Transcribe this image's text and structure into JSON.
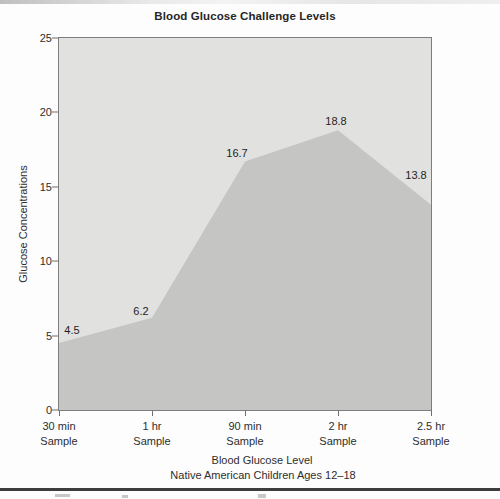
{
  "chart_data": {
    "type": "area",
    "title": "Blood Glucose Challenge Levels",
    "categories": [
      "30 min Sample",
      "1 hr Sample",
      "90 min Sample",
      "2 hr Sample",
      "2.5 hr Sample"
    ],
    "category_label_lines": [
      [
        "30 min",
        "Sample"
      ],
      [
        "1 hr",
        "Sample"
      ],
      [
        "90 min",
        "Sample"
      ],
      [
        "2 hr",
        "Sample"
      ],
      [
        "2.5 hr",
        "Sample"
      ]
    ],
    "values": [
      4.5,
      6.2,
      16.7,
      18.8,
      13.8
    ],
    "data_labels": [
      "4.5",
      "6.2",
      "16.7",
      "18.8",
      "13.8"
    ],
    "ylabel": "Glucose Concentrations",
    "xlabel": "Blood Glucose Level",
    "xlabel_subtitle": "Native American Children Ages 12–18",
    "ylim": [
      0,
      25
    ],
    "yticks": [
      0,
      5,
      10,
      15,
      20,
      25
    ],
    "grid": false,
    "legend": "none",
    "colors": {
      "area_fill": "#c5c5c3",
      "plot_background": "#e1e1df",
      "axis_line": "#6f6f6f",
      "text": "#262626"
    }
  }
}
